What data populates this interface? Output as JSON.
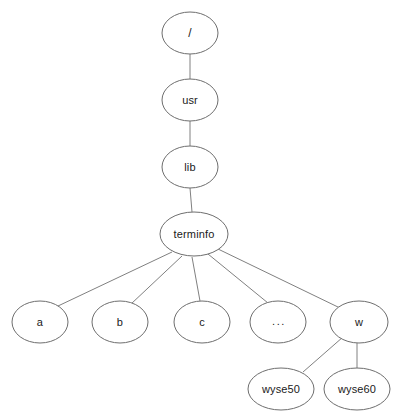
{
  "diagram": {
    "type": "tree",
    "background_color": "#ffffff",
    "node_fill_color": "#ffffff",
    "node_stroke_color": "#6e6e6e",
    "edge_color": "#808080",
    "label_color": "#1a1a1a",
    "nodes": [
      {
        "id": "root",
        "label": "/",
        "cx": 190,
        "cy": 33,
        "rx": 28,
        "ry": 21
      },
      {
        "id": "usr",
        "label": "usr",
        "cx": 190,
        "cy": 100,
        "rx": 28,
        "ry": 21
      },
      {
        "id": "lib",
        "label": "lib",
        "cx": 190,
        "cy": 167,
        "rx": 28,
        "ry": 21
      },
      {
        "id": "terminfo",
        "label": "terminfo",
        "cx": 194,
        "cy": 234,
        "rx": 34,
        "ry": 22
      },
      {
        "id": "a",
        "label": "a",
        "cx": 40,
        "cy": 322,
        "rx": 28,
        "ry": 21
      },
      {
        "id": "b",
        "label": "b",
        "cx": 120,
        "cy": 322,
        "rx": 28,
        "ry": 21
      },
      {
        "id": "c",
        "label": "c",
        "cx": 202,
        "cy": 322,
        "rx": 28,
        "ry": 21
      },
      {
        "id": "more",
        "label": "...",
        "cx": 278,
        "cy": 322,
        "rx": 28,
        "ry": 21
      },
      {
        "id": "w",
        "label": "w",
        "cx": 359,
        "cy": 322,
        "rx": 29,
        "ry": 21
      },
      {
        "id": "wyse50",
        "label": "wyse50",
        "cx": 281,
        "cy": 389,
        "rx": 33,
        "ry": 21
      },
      {
        "id": "wyse60",
        "label": "wyse60",
        "cx": 357,
        "cy": 389,
        "rx": 33,
        "ry": 21
      }
    ],
    "edges": [
      {
        "id": "edge-root-usr",
        "from": "root",
        "to": "usr",
        "x1": 190,
        "y1": 54,
        "x2": 190,
        "y2": 79
      },
      {
        "id": "edge-usr-lib",
        "from": "usr",
        "to": "lib",
        "x1": 190,
        "y1": 121,
        "x2": 190,
        "y2": 146
      },
      {
        "id": "edge-lib-terminfo",
        "from": "lib",
        "to": "terminfo",
        "x1": 190,
        "y1": 188,
        "x2": 192,
        "y2": 212
      },
      {
        "id": "edge-terminfo-a",
        "from": "terminfo",
        "to": "a",
        "x1": 172,
        "y1": 252,
        "x2": 58,
        "y2": 306
      },
      {
        "id": "edge-terminfo-b",
        "from": "terminfo",
        "to": "b",
        "x1": 182,
        "y1": 256,
        "x2": 131,
        "y2": 304
      },
      {
        "id": "edge-terminfo-c",
        "from": "terminfo",
        "to": "c",
        "x1": 192,
        "y1": 257,
        "x2": 200,
        "y2": 301
      },
      {
        "id": "edge-terminfo-more",
        "from": "terminfo",
        "to": "more",
        "x1": 208,
        "y1": 254,
        "x2": 268,
        "y2": 303
      },
      {
        "id": "edge-terminfo-w",
        "from": "terminfo",
        "to": "w",
        "x1": 218,
        "y1": 249,
        "x2": 340,
        "y2": 308
      },
      {
        "id": "edge-w-wyse50",
        "from": "w",
        "to": "wyse50",
        "x1": 343,
        "y1": 337,
        "x2": 303,
        "y2": 372
      },
      {
        "id": "edge-w-wyse60",
        "from": "w",
        "to": "wyse60",
        "x1": 357,
        "y1": 343,
        "x2": 357,
        "y2": 368
      }
    ]
  }
}
